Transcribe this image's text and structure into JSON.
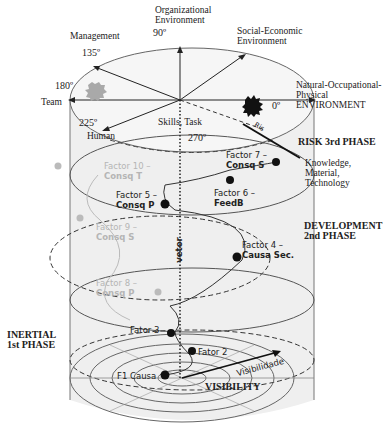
{
  "axes": {
    "deg_90": "90º",
    "deg_135": "135º",
    "deg_180": "180º",
    "deg_225": "225º",
    "deg_270": "270º",
    "deg_0": "0º",
    "organizational": [
      "Organizational",
      "Environment"
    ],
    "social_economic": [
      "Social-Economic",
      "Environment"
    ],
    "management": "Management",
    "team": "Team",
    "human": "Human",
    "skills_task": "Skills, Task",
    "natural": [
      "Natural-Occupational-",
      "Physical",
      "ENVIRONMENT"
    ],
    "knowledge": [
      "Knowledge,",
      "Material,",
      "Technology"
    ]
  },
  "phases": {
    "risk": "RISK 3rd PHASE",
    "development": [
      "DEVELOPMENT",
      "2nd PHASE"
    ],
    "inertial": [
      "INERTIAL",
      "1st PHASE"
    ]
  },
  "factors": [
    {
      "id": "f1",
      "label": "F1 Causa",
      "faded": false
    },
    {
      "id": "f2",
      "label": "Fator 2",
      "faded": false
    },
    {
      "id": "f3",
      "label": "Fator 3",
      "faded": false
    },
    {
      "id": "f4",
      "label1": "Factor 4 –",
      "label2": "Causa Sec.",
      "faded": false
    },
    {
      "id": "f5",
      "label1": "Factor 5 –",
      "label2": "Consq P",
      "faded": false
    },
    {
      "id": "f6",
      "label1": "Factor 6 –",
      "label2": "FeedB",
      "faded": false
    },
    {
      "id": "f7",
      "label1": "Factor 7 –",
      "label2": "Consq S",
      "faded": false
    },
    {
      "id": "f8",
      "label1": "Factor 8 –",
      "label2": "Consq P",
      "faded": true
    },
    {
      "id": "f9",
      "label1": "Factor 9 –",
      "label2": "Consq S",
      "faded": true
    },
    {
      "id": "f10",
      "label1": "Factor 10 –",
      "label2": "Consq T",
      "faded": true
    }
  ],
  "vetor": "vetor",
  "visibility": "VISIBILITY",
  "visibilidade": "Visibilidade",
  "risk_arrow_text": "Ris"
}
